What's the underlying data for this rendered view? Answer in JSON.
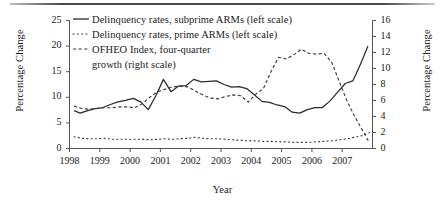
{
  "chart_data": {
    "type": "line",
    "title": "",
    "xlabel": "Year",
    "ylabel": "Percentage Change",
    "ylabel_right": "Percentage Change",
    "grid": false,
    "legend_position": "top-left",
    "xlim": [
      1998.0,
      2008.0
    ],
    "ylim": [
      0,
      25
    ],
    "ylim_right": [
      0,
      16
    ],
    "xticks": [
      1998,
      1999,
      2000,
      2001,
      2002,
      2003,
      2004,
      2005,
      2006,
      2007
    ],
    "xtick_labels": [
      "1998",
      "1999",
      "2000",
      "2001",
      "2002",
      "2003",
      "2004",
      "2005",
      "2006",
      "2007"
    ],
    "yticks": [
      0,
      5,
      10,
      15,
      20,
      25
    ],
    "ytick_labels": [
      "0",
      "5",
      "10",
      "15",
      "20",
      "25"
    ],
    "yticks_right": [
      0,
      2,
      4,
      6,
      8,
      10,
      12,
      14,
      16
    ],
    "ytick_labels_right": [
      "0",
      "2",
      "4",
      "6",
      "8",
      "10",
      "12",
      "14",
      "16"
    ],
    "series": [
      {
        "name": "Delinquency rates, subprime ARMs (left scale)",
        "legend_label_line1": "Delinquency rates, subprime ARMs (left scale)",
        "axis": "left",
        "style": "solid",
        "color": "#2b2b2b",
        "x": [
          1998.15,
          1998.35,
          1998.6,
          1998.85,
          1999.1,
          1999.35,
          1999.6,
          1999.85,
          2000.1,
          2000.35,
          2000.6,
          2000.85,
          2001.1,
          2001.35,
          2001.6,
          2001.85,
          2002.1,
          2002.35,
          2002.6,
          2002.85,
          2003.1,
          2003.35,
          2003.6,
          2003.85,
          2004.1,
          2004.35,
          2004.6,
          2004.85,
          2005.1,
          2005.35,
          2005.6,
          2005.85,
          2006.1,
          2006.35,
          2006.6,
          2006.85,
          2007.1,
          2007.35,
          2007.6,
          2007.85
        ],
        "y": [
          7.4,
          6.9,
          7.4,
          7.8,
          8.0,
          8.6,
          9.1,
          9.4,
          9.8,
          9.1,
          7.6,
          10.3,
          13.5,
          11.1,
          12.2,
          12.3,
          13.5,
          13.0,
          13.1,
          13.2,
          12.5,
          12.0,
          12.1,
          11.7,
          10.5,
          9.2,
          9.0,
          8.5,
          8.2,
          7.1,
          6.9,
          7.6,
          8.0,
          8.0,
          9.3,
          11.0,
          12.7,
          13.2,
          16.4,
          20.0
        ]
      },
      {
        "name": "Delinquency rates, prime ARMs (left scale)",
        "legend_label_line1": "Delinquency rates, prime ARMs (left scale)",
        "axis": "left",
        "style": "dotted",
        "color": "#3a3a3a",
        "x": [
          1998.15,
          1998.4,
          1998.65,
          1998.9,
          1999.15,
          1999.4,
          1999.65,
          1999.9,
          2000.15,
          2000.4,
          2000.65,
          2000.9,
          2001.15,
          2001.4,
          2001.65,
          2001.9,
          2002.15,
          2002.4,
          2002.65,
          2002.9,
          2003.15,
          2003.4,
          2003.65,
          2003.9,
          2004.15,
          2004.4,
          2004.65,
          2004.9,
          2005.15,
          2005.4,
          2005.65,
          2005.9,
          2006.15,
          2006.4,
          2006.65,
          2006.9,
          2007.15,
          2007.4,
          2007.65,
          2007.9
        ],
        "y": [
          2.3,
          2.0,
          1.9,
          1.9,
          2.0,
          1.8,
          1.8,
          1.8,
          1.8,
          1.8,
          1.7,
          1.8,
          1.9,
          1.8,
          1.9,
          2.0,
          2.2,
          2.0,
          1.9,
          1.9,
          1.8,
          1.7,
          1.6,
          1.5,
          1.5,
          1.4,
          1.4,
          1.3,
          1.3,
          1.2,
          1.2,
          1.2,
          1.3,
          1.4,
          1.5,
          1.7,
          1.9,
          2.2,
          2.5,
          3.1
        ]
      },
      {
        "name": "OFHEO Index, four-quarter growth (right scale)",
        "legend_label_line1": "OFHEO Index, four-quarter",
        "legend_label_line2": "growth (right scale)",
        "axis": "right",
        "style": "dashed",
        "color": "#3a3a3a",
        "x": [
          1998.15,
          1998.4,
          1998.65,
          1998.9,
          1999.15,
          1999.4,
          1999.65,
          1999.9,
          2000.15,
          2000.4,
          2000.65,
          2000.9,
          2001.15,
          2001.4,
          2001.65,
          2001.9,
          2002.15,
          2002.4,
          2002.65,
          2002.9,
          2003.15,
          2003.4,
          2003.65,
          2003.9,
          2004.15,
          2004.4,
          2004.65,
          2004.9,
          2005.15,
          2005.4,
          2005.65,
          2005.9,
          2006.15,
          2006.4,
          2006.65,
          2006.9,
          2007.15,
          2007.4,
          2007.65,
          2007.9
        ],
        "y": [
          5.3,
          5.0,
          4.9,
          5.0,
          5.1,
          5.1,
          5.2,
          5.2,
          5.1,
          5.6,
          6.4,
          7.1,
          7.4,
          7.7,
          7.8,
          7.7,
          7.2,
          6.7,
          6.3,
          6.2,
          6.5,
          6.7,
          6.6,
          5.8,
          6.8,
          7.5,
          9.6,
          11.4,
          11.2,
          11.7,
          12.4,
          11.9,
          11.8,
          11.9,
          10.8,
          8.4,
          6.0,
          4.1,
          2.4,
          0.7
        ]
      }
    ]
  },
  "axes": {
    "left_title": "Percentage Change",
    "right_title": "Percentage Change",
    "bottom_title": "Year"
  }
}
